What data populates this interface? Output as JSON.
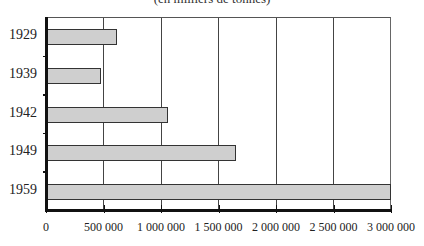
{
  "chart_data": {
    "type": "bar",
    "orientation": "horizontal",
    "title": "",
    "subtitle": "(en milliers de tonnes)",
    "categories": [
      "1929",
      "1939",
      "1942",
      "1949",
      "1959"
    ],
    "values": [
      620000,
      475000,
      1065000,
      1650000,
      3000000
    ],
    "xlabel": "",
    "ylabel": "",
    "xlim": [
      0,
      3000000
    ],
    "xticks": [
      "0",
      "500 000",
      "1 000 000",
      "1 500 000",
      "2 000 000",
      "2 500 000",
      "3 000 000"
    ],
    "grid": "vertical",
    "legend": null,
    "bar_color": "#cfcfcf"
  }
}
